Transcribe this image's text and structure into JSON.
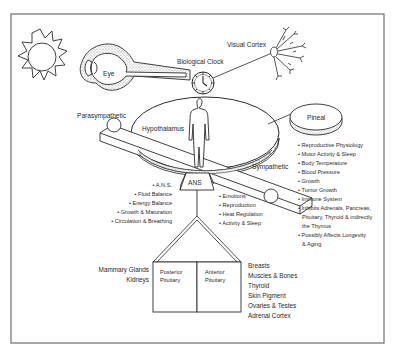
{
  "diagram": {
    "labels": {
      "eye": "Eye",
      "biological_clock": "Biological Clock",
      "visual_cortex": "Visual Cortex",
      "parasympathetic": "Parasympathetic",
      "hypothalamus": "Hypothalamus",
      "pineal": "Pineal",
      "sympathetic": "Sympathetic",
      "ans": "ANS",
      "posterior_pituitary_1": "Posterior",
      "posterior_pituitary_2": "Pituitary",
      "anterior_pituitary_1": "Anterior",
      "anterior_pituitary_2": "Pituitary"
    },
    "hypothalamus_functions": [
      "A.N.S.",
      "Fluid Balance",
      "Energy Balance",
      "Growth & Maturation",
      "Circulation & Breathing"
    ],
    "ans_functions": [
      "Emotions",
      "Reproduction",
      "Heat Regulation",
      "Activity & Sleep"
    ],
    "pineal_functions": [
      "Reproductive Physiology",
      "Motor Activity & Sleep",
      "Body Temperature",
      "Blood Pressure",
      "Growth",
      "Tumor Growth",
      "Immune System",
      "Inhibits Adrenals, Pancreas,",
      "Pituitary, Thyroid & indirectly",
      "the Thymus",
      "Possibly Affects Longevity",
      "& Aging"
    ],
    "posterior_targets": [
      "Mammary Glands",
      "Kidneys"
    ],
    "anterior_targets": [
      "Breasts",
      "Muscles & Bones",
      "Thyroid",
      "Skin Pigment",
      "Ovaries & Testes",
      "Adrenal Cortex"
    ],
    "colors": {
      "line": "#2a2a2a",
      "frame": "#777777",
      "stipple": "#bdbdbd",
      "background": "#ffffff"
    }
  }
}
